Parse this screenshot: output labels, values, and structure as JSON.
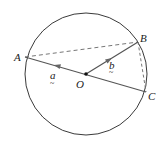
{
  "figure": {
    "type": "geometry",
    "colors": {
      "circle": "#3a3a3a",
      "solid_line": "#555555",
      "dashed_line": "#777777",
      "arrow": "#666666",
      "point": "#111111",
      "label": "#222222"
    },
    "circle": {
      "cx": 86,
      "cy": 74,
      "r": 61
    },
    "points": {
      "A": {
        "x": 25,
        "y": 57,
        "label": "A"
      },
      "B": {
        "x": 138,
        "y": 42,
        "label": "B"
      },
      "C": {
        "x": 146,
        "y": 92,
        "label": "C"
      },
      "O": {
        "x": 86,
        "y": 74,
        "label": "O"
      }
    },
    "vectors": {
      "a": {
        "label": "a",
        "underline": "~",
        "from": "O",
        "to": "A"
      },
      "b": {
        "label": "b",
        "underline": "~",
        "from": "O",
        "to": "B"
      }
    },
    "segments": [
      {
        "from": "A",
        "to": "C",
        "style": "solid"
      },
      {
        "from": "O",
        "to": "B",
        "style": "solid"
      },
      {
        "from": "A",
        "to": "B",
        "style": "dashed"
      },
      {
        "from": "B",
        "to": "C",
        "style": "dashed"
      }
    ]
  }
}
